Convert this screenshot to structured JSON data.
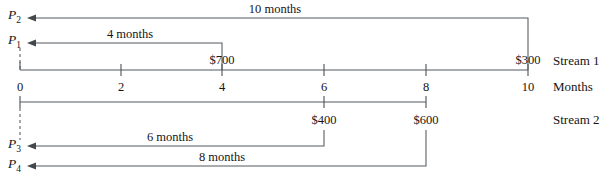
{
  "diagram": {
    "axis_unit_label": "Months",
    "stream1_label": "Stream 1",
    "stream2_label": "Stream 2",
    "tick_labels": [
      "0",
      "2",
      "4",
      "6",
      "8",
      "10"
    ],
    "tick_months": [
      0,
      2,
      4,
      6,
      8,
      10
    ],
    "axis_start_month": 0,
    "axis_end_month": 10,
    "colors": {
      "line": "#555a5e",
      "text": "#151515",
      "background": "#ffffff"
    },
    "arrows": [
      {
        "name": "p2-arrow",
        "label": "10 months",
        "from_month": 10,
        "to_month": 0,
        "present_value_symbol": "P",
        "present_value_subscript": "2"
      },
      {
        "name": "p1-arrow",
        "label": "4 months",
        "from_month": 4,
        "to_month": 0,
        "present_value_symbol": "P",
        "present_value_subscript": "1"
      },
      {
        "name": "p3-arrow",
        "label": "6 months",
        "from_month": 6,
        "to_month": 0,
        "present_value_symbol": "P",
        "present_value_subscript": "3"
      },
      {
        "name": "p4-arrow",
        "label": "8 months",
        "from_month": 8,
        "to_month": 0,
        "present_value_symbol": "P",
        "present_value_subscript": "4"
      }
    ],
    "cash_flows": [
      {
        "name": "cashflow-700",
        "amount": "$700",
        "month": 4,
        "stream": 1
      },
      {
        "name": "cashflow-300",
        "amount": "$300",
        "month": 10,
        "stream": 1
      },
      {
        "name": "cashflow-400",
        "amount": "$400",
        "month": 6,
        "stream": 2
      },
      {
        "name": "cashflow-600",
        "amount": "$600",
        "month": 8,
        "stream": 2
      }
    ]
  }
}
